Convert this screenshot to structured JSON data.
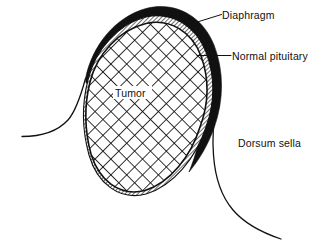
{
  "figure": {
    "background_color": "#ffffff",
    "ink_color": "#111111",
    "width": 323,
    "height": 252
  },
  "labels": {
    "diaphragm": "Diaphragm",
    "normal_pituitary": "Normal pituitary",
    "tumor": "Tumor",
    "dorsum_sella": "Dorsum sella"
  },
  "regions": [
    {
      "name": "diaphragm",
      "label": "Diaphragm",
      "fill": "solid-black",
      "color": "#111111",
      "description": "thick black crescent capping the superior and right margin of the mass"
    },
    {
      "name": "normal-pituitary",
      "label": "Normal pituitary",
      "fill": "diagonal-hatch",
      "color": "#111111",
      "description": "thin diagonally hatched rim between the diaphragm and the tumor"
    },
    {
      "name": "tumor",
      "label": "Tumor",
      "fill": "cross-hatch",
      "color": "#111111",
      "description": "large cross-hatched ovoid mass filling the sella"
    },
    {
      "name": "dorsum-sella",
      "label": "Dorsum sella",
      "fill": "none",
      "color": "#111111",
      "description": "bone contour curve descending to the lower right of the mass"
    },
    {
      "name": "sella-floor-left",
      "label": "",
      "fill": "none",
      "color": "#111111",
      "description": "thin bone contour curve sweeping from the left margin to the mass"
    }
  ],
  "leaders": [
    {
      "name": "diaphragm-leader",
      "style": "diagonal",
      "from": "black crescent apex",
      "to": "Diaphragm label"
    },
    {
      "name": "normal-pituitary-leader",
      "style": "horizontal",
      "from": "hatched rim",
      "to": "Normal pituitary label"
    }
  ]
}
